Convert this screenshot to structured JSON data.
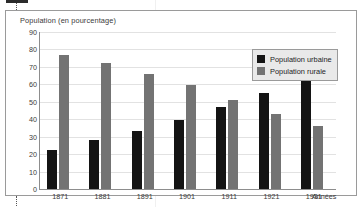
{
  "chart_data": {
    "type": "bar",
    "title": "Population (en pourcentage)",
    "xlabel": "Années",
    "ylabel": "",
    "categories": [
      "1871",
      "1881",
      "1891",
      "1901",
      "1911",
      "1921",
      "1931"
    ],
    "series": [
      {
        "name": "Population urbaine",
        "color": "#141414",
        "values": [
          22.5,
          28,
          33.5,
          39.5,
          47,
          55,
          62
        ]
      },
      {
        "name": "Population rurale",
        "color": "#737373",
        "values": [
          77,
          72,
          66,
          59.5,
          51,
          43,
          36
        ]
      }
    ],
    "ylim": [
      0,
      90
    ],
    "ytick_labels": [
      "0",
      "10",
      "20",
      "30",
      "40",
      "50",
      "60",
      "70",
      "80",
      "90"
    ],
    "ytick_values": [
      0,
      10,
      20,
      30,
      40,
      50,
      60,
      70,
      80,
      90
    ],
    "grid": true,
    "legend_position": "top-right"
  }
}
